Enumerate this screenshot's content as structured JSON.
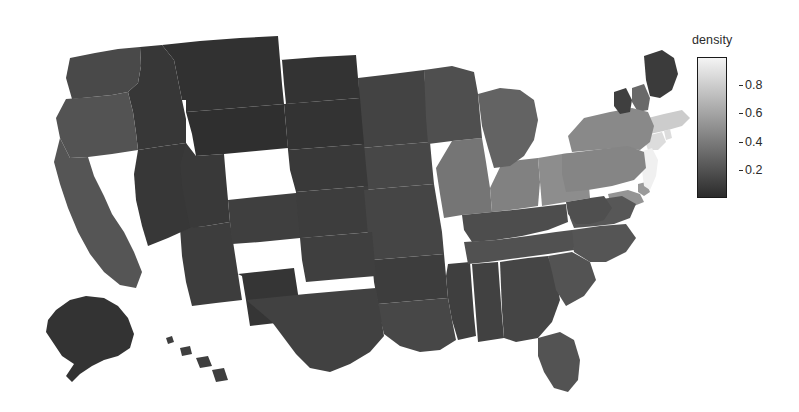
{
  "figure": {
    "background_color": "#ffffff",
    "width": 799,
    "height": 412
  },
  "legend": {
    "title": "density",
    "orientation": "vertical",
    "tick_labels": [
      "0.8",
      "0.6",
      "0.4",
      "0.2"
    ],
    "tick_values": [
      0.8,
      0.6,
      0.4,
      0.2
    ],
    "gradient_top_color": "#f4f4f4",
    "gradient_bottom_color": "#2b2b2b",
    "border_color": "#1a1a1a",
    "text_color": "#2b2b2b"
  },
  "chart_data": {
    "type": "heatmap",
    "subtype": "choropleth-map",
    "title": "",
    "xlabel": "",
    "ylabel": "",
    "colorbar_label": "density",
    "colormap": "grayscale (dark = low, light = high)",
    "value_range": [
      0.0,
      1.0
    ],
    "colorbar_ticks": [
      0.2,
      0.4,
      0.6,
      0.8
    ],
    "region_type": "US states",
    "grid": false,
    "legend_position": "right",
    "regions": [
      {
        "code": "AL",
        "name": "Alabama",
        "value": 0.11
      },
      {
        "code": "AK",
        "name": "Alaska",
        "value": 0.04
      },
      {
        "code": "AZ",
        "name": "Arizona",
        "value": 0.09
      },
      {
        "code": "AR",
        "name": "Arkansas",
        "value": 0.09
      },
      {
        "code": "CA",
        "name": "California",
        "value": 0.21
      },
      {
        "code": "CO",
        "name": "Colorado",
        "value": 0.1
      },
      {
        "code": "CT",
        "name": "Connecticut",
        "value": 0.88
      },
      {
        "code": "DE",
        "name": "Delaware",
        "value": 0.55
      },
      {
        "code": "FL",
        "name": "Florida",
        "value": 0.2
      },
      {
        "code": "GA",
        "name": "Georgia",
        "value": 0.13
      },
      {
        "code": "HI",
        "name": "Hawaii",
        "value": 0.1
      },
      {
        "code": "ID",
        "name": "Idaho",
        "value": 0.06
      },
      {
        "code": "IL",
        "name": "Illinois",
        "value": 0.37
      },
      {
        "code": "IN",
        "name": "Indiana",
        "value": 0.43
      },
      {
        "code": "IA",
        "name": "Iowa",
        "value": 0.14
      },
      {
        "code": "KS",
        "name": "Kansas",
        "value": 0.09
      },
      {
        "code": "KY",
        "name": "Kentucky",
        "value": 0.17
      },
      {
        "code": "LA",
        "name": "Louisiana",
        "value": 0.14
      },
      {
        "code": "ME",
        "name": "Maine",
        "value": 0.08
      },
      {
        "code": "MD",
        "name": "Maryland",
        "value": 0.52
      },
      {
        "code": "MA",
        "name": "Massachusetts",
        "value": 0.8
      },
      {
        "code": "MI",
        "name": "Michigan",
        "value": 0.28
      },
      {
        "code": "MN",
        "name": "Minnesota",
        "value": 0.12
      },
      {
        "code": "MS",
        "name": "Mississippi",
        "value": 0.1
      },
      {
        "code": "MO",
        "name": "Missouri",
        "value": 0.13
      },
      {
        "code": "MT",
        "name": "Montana",
        "value": 0.03
      },
      {
        "code": "NE",
        "name": "Nebraska",
        "value": 0.07
      },
      {
        "code": "NV",
        "name": "Nevada",
        "value": 0.06
      },
      {
        "code": "NH",
        "name": "New Hampshire",
        "value": 0.31
      },
      {
        "code": "NJ",
        "name": "New Jersey",
        "value": 0.98
      },
      {
        "code": "NM",
        "name": "New Mexico",
        "value": 0.05
      },
      {
        "code": "NY",
        "name": "New York",
        "value": 0.47
      },
      {
        "code": "NC",
        "name": "North Carolina",
        "value": 0.21
      },
      {
        "code": "ND",
        "name": "North Dakota",
        "value": 0.04
      },
      {
        "code": "OH",
        "name": "Ohio",
        "value": 0.49
      },
      {
        "code": "OK",
        "name": "Oklahoma",
        "value": 0.1
      },
      {
        "code": "OR",
        "name": "Oregon",
        "value": 0.2
      },
      {
        "code": "PA",
        "name": "Pennsylvania",
        "value": 0.45
      },
      {
        "code": "RI",
        "name": "Rhode Island",
        "value": 0.88
      },
      {
        "code": "SC",
        "name": "South Carolina",
        "value": 0.2
      },
      {
        "code": "SD",
        "name": "South Dakota",
        "value": 0.04
      },
      {
        "code": "TN",
        "name": "Tennessee",
        "value": 0.19
      },
      {
        "code": "TX",
        "name": "Texas",
        "value": 0.11
      },
      {
        "code": "UT",
        "name": "Utah",
        "value": 0.07
      },
      {
        "code": "VT",
        "name": "Vermont",
        "value": 0.1
      },
      {
        "code": "VA",
        "name": "Virginia",
        "value": 0.22
      },
      {
        "code": "WA",
        "name": "Washington",
        "value": 0.15
      },
      {
        "code": "WV",
        "name": "West Virginia",
        "value": 0.18
      },
      {
        "code": "WI",
        "name": "Wisconsin",
        "value": 0.18
      },
      {
        "code": "WY",
        "name": "Wyoming",
        "value": 0.02
      }
    ]
  }
}
